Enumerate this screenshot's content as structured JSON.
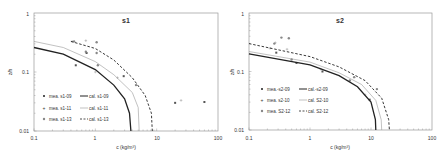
{
  "chart_data": [
    {
      "type": "scatter",
      "title": "s1",
      "xlabel": "c (kg/m³)",
      "ylabel": "z/h",
      "xscale": "log",
      "yscale": "log",
      "xlim": [
        0.1,
        100
      ],
      "ylim": [
        0.01,
        1
      ],
      "x_ticks": [
        "0.1",
        "1",
        "10",
        "100"
      ],
      "y_ticks": [
        "0.01",
        "0.1",
        "1"
      ],
      "legend_position": "lower left inside",
      "series": [
        {
          "name": "mea. s1-09",
          "kind": "marker",
          "marker": "square",
          "color": "#555555",
          "points": [
            [
              0.48,
              0.13
            ],
            [
              0.72,
              0.21
            ],
            [
              2.9,
              0.085
            ],
            [
              20,
              0.03
            ],
            [
              60,
              0.031
            ]
          ]
        },
        {
          "name": "mea. s1-11",
          "kind": "marker",
          "marker": "plus",
          "color": "#999999",
          "points": [
            [
              0.42,
              0.33
            ],
            [
              0.7,
              0.34
            ],
            [
              1.0,
              0.1
            ],
            [
              2.3,
              0.08
            ],
            [
              25,
              0.033
            ]
          ]
        },
        {
          "name": "mea. s1-13",
          "kind": "marker",
          "marker": "circle",
          "color": "#888888",
          "points": [
            [
              0.45,
              0.33
            ],
            [
              0.7,
              0.22
            ],
            [
              1.05,
              0.32
            ],
            [
              1.05,
              0.21
            ],
            [
              1.1,
              0.13
            ],
            [
              4.6,
              0.06
            ]
          ]
        },
        {
          "name": "cal. s1-09",
          "kind": "line",
          "style": "solid-thick",
          "color": "#222222",
          "points": [
            [
              0.1,
              0.26
            ],
            [
              0.3,
              0.2
            ],
            [
              1,
              0.11
            ],
            [
              2,
              0.06
            ],
            [
              3,
              0.035
            ],
            [
              3.6,
              0.02
            ],
            [
              3.8,
              0.01
            ]
          ]
        },
        {
          "name": "cal. s1-11",
          "kind": "line",
          "style": "solid-thin",
          "color": "#999999",
          "points": [
            [
              0.1,
              0.33
            ],
            [
              0.3,
              0.26
            ],
            [
              1,
              0.15
            ],
            [
              2,
              0.09
            ],
            [
              4,
              0.045
            ],
            [
              5,
              0.025
            ],
            [
              5.2,
              0.01
            ]
          ]
        },
        {
          "name": "cal. s1-13",
          "kind": "line",
          "style": "dashed",
          "color": "#222222",
          "points": [
            [
              0.4,
              0.33
            ],
            [
              1,
              0.25
            ],
            [
              2,
              0.16
            ],
            [
              4,
              0.08
            ],
            [
              6.5,
              0.04
            ],
            [
              8.2,
              0.02
            ],
            [
              8.5,
              0.01
            ]
          ]
        }
      ]
    },
    {
      "type": "scatter",
      "title": "s2",
      "xlabel": "c (kg/m³)",
      "ylabel": "z/h",
      "xscale": "log",
      "yscale": "log",
      "xlim": [
        0.1,
        100
      ],
      "ylim": [
        0.01,
        1
      ],
      "x_ticks": [
        "0.1",
        "1",
        "10",
        "100"
      ],
      "y_ticks": [
        "0.01",
        "0.1",
        "1"
      ],
      "legend_position": "lower left inside",
      "series": [
        {
          "name": "mea.-s2-09",
          "kind": "marker",
          "marker": "square",
          "color": "#555555",
          "points": [
            [
              0.28,
              0.21
            ],
            [
              0.6,
              0.14
            ],
            [
              1.6,
              0.1
            ],
            [
              9.5,
              0.033
            ]
          ]
        },
        {
          "name": "mea. s2-10",
          "kind": "marker",
          "marker": "plus",
          "color": "#999999",
          "points": [
            [
              0.22,
              0.25
            ],
            [
              0.27,
              0.31
            ],
            [
              0.42,
              0.24
            ],
            [
              1.5,
              0.11
            ],
            [
              8,
              0.04
            ]
          ]
        },
        {
          "name": "mea. S2-12",
          "kind": "marker",
          "marker": "circle",
          "color": "#888888",
          "points": [
            [
              0.26,
              0.3
            ],
            [
              0.34,
              0.38
            ],
            [
              0.45,
              0.37
            ],
            [
              0.5,
              0.16
            ],
            [
              4.5,
              0.07
            ],
            [
              5.3,
              0.08
            ],
            [
              12.5,
              0.05
            ]
          ]
        },
        {
          "name": "cal.-s2-09",
          "kind": "line",
          "style": "solid-thick",
          "color": "#222222",
          "points": [
            [
              0.1,
              0.2
            ],
            [
              1,
              0.13
            ],
            [
              3,
              0.085
            ],
            [
              6,
              0.055
            ],
            [
              10,
              0.03
            ],
            [
              11.8,
              0.015
            ],
            [
              12,
              0.01
            ]
          ]
        },
        {
          "name": "cal. S2-10",
          "kind": "line",
          "style": "solid-thin",
          "color": "#999999",
          "points": [
            [
              0.1,
              0.22
            ],
            [
              1,
              0.145
            ],
            [
              3,
              0.095
            ],
            [
              7,
              0.06
            ],
            [
              12,
              0.032
            ],
            [
              14.7,
              0.015
            ],
            [
              15,
              0.01
            ]
          ]
        },
        {
          "name": "cal. S2-12",
          "kind": "line",
          "style": "dashed",
          "color": "#222222",
          "points": [
            [
              0.1,
              0.3
            ],
            [
              1,
              0.18
            ],
            [
              3,
              0.12
            ],
            [
              8,
              0.07
            ],
            [
              15,
              0.035
            ],
            [
              19.5,
              0.015
            ],
            [
              20,
              0.01
            ]
          ]
        }
      ]
    }
  ],
  "charts": [
    {
      "title": "s1",
      "xlabel": "c (kg/m³)",
      "ylabel": "z/h",
      "yticks": [
        "1",
        "0.1",
        "0.01"
      ],
      "xticks": [
        "0.1",
        "1",
        "10",
        "100"
      ],
      "legend": [
        {
          "mea": "mea. s1-09",
          "cal": "cal. s1-09"
        },
        {
          "mea": "mea. s1-11",
          "cal": "cal. s1-11"
        },
        {
          "mea": "mea. s1-13",
          "cal": "cal. s1-13"
        }
      ]
    },
    {
      "title": "s2",
      "xlabel": "c (kg/m³)",
      "ylabel": "z/h",
      "yticks": [
        "1",
        "0.1",
        "0.01"
      ],
      "xticks": [
        "0.1",
        "1",
        "10",
        "100"
      ],
      "legend": [
        {
          "mea": "mea.-s2-09",
          "cal": "cal.-s2-09"
        },
        {
          "mea": "mea. s2-10",
          "cal": "cal. S2-10"
        },
        {
          "mea": "mea. S2-12",
          "cal": "cal. S2-12"
        }
      ]
    }
  ]
}
